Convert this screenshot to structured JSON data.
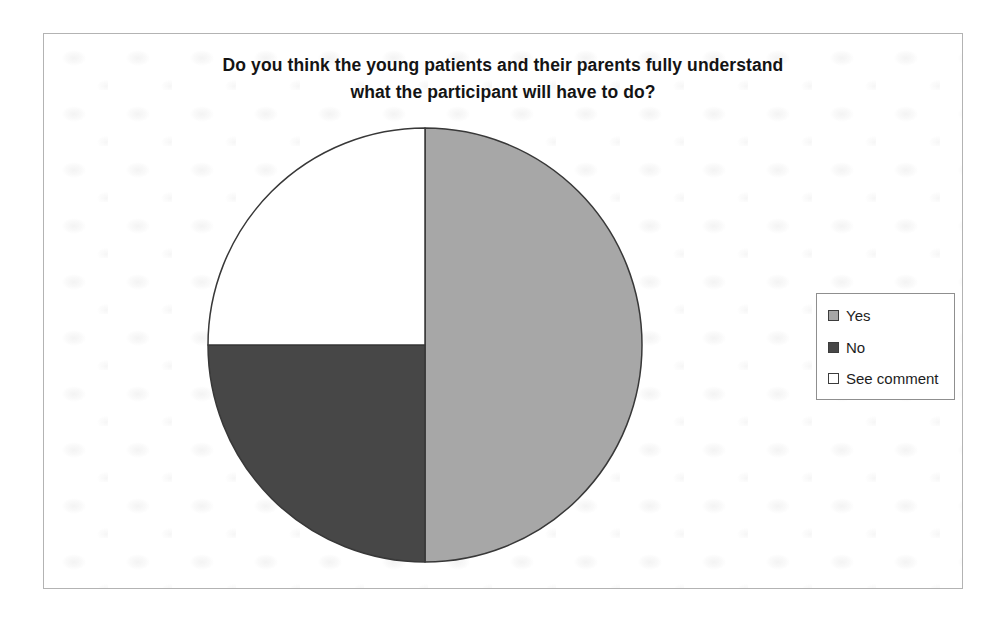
{
  "page": {
    "background_color": "#ffffff"
  },
  "chart_data": {
    "type": "pie",
    "title": "Do you think the young patients and their parents fully understand what the participant will have to do?",
    "title_lines": [
      "Do you think the young patients and their parents fully understand",
      "what the participant will have to do?"
    ],
    "slices": [
      {
        "label": "Yes",
        "value": 50,
        "color": "#a7a7a7"
      },
      {
        "label": "No",
        "value": 25,
        "color": "#474747"
      },
      {
        "label": "See comment",
        "value": 25,
        "color": "#ffffff"
      }
    ],
    "values_unit": "percent-of-circle (estimated from slice angles)",
    "start_angle_deg": 0,
    "direction": "clockwise",
    "legend_position": "right",
    "outline_color": "#383838"
  }
}
